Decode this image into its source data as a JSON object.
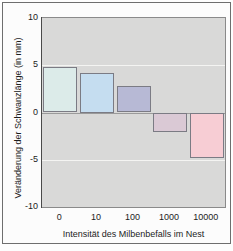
{
  "chart_data": {
    "type": "bar",
    "title": "",
    "xlabel": "Intensität des Milbenbefalls im Nest",
    "ylabel": "Veränderung der Schwanzlänge (in mm)",
    "categories": [
      "0",
      "10",
      "100",
      "1000",
      "10000"
    ],
    "values": [
      4.8,
      4.2,
      2.8,
      -2.0,
      -4.8
    ],
    "ylim": [
      -10,
      10
    ],
    "yticks": [
      "10",
      "5",
      "0",
      "-5",
      "-10"
    ],
    "ytick_values": [
      10,
      5,
      0,
      -5,
      -10
    ],
    "grid": true,
    "legend": "none",
    "bar_colors": [
      "#dcebe9",
      "#c5ddf0",
      "#b7b9d5",
      "#dac9d5",
      "#f7cdd4"
    ],
    "bar_border_color": "#7b7b84",
    "plot_background": "#d9d9d8",
    "gridline_color": "#f4f4f2",
    "zeroline_color": "#9a9a9a"
  }
}
